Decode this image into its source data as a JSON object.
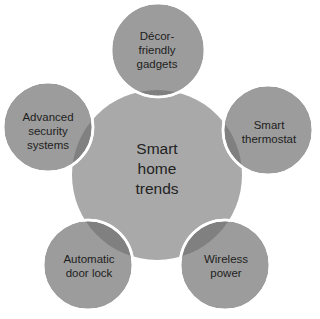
{
  "diagram": {
    "type": "radial-venn",
    "colors": {
      "background": "#ffffff",
      "main_fill": "#a8a8a8",
      "satellite_fill": "#9a9a9a",
      "overlap_fill": "#7f7f7f",
      "stroke": "#ffffff",
      "text": "#1e1e1e"
    },
    "center": {
      "lines": [
        "Smart",
        "home",
        "trends"
      ],
      "cx": 157,
      "cy": 175,
      "r": 85
    },
    "satellites": [
      {
        "id": "decor",
        "lines": [
          "Décor-",
          "friendly",
          "gadgets"
        ],
        "cx": 158,
        "cy": 50,
        "r": 47
      },
      {
        "id": "thermostat",
        "lines": [
          "Smart",
          "thermostat"
        ],
        "cx": 268,
        "cy": 130,
        "r": 45
      },
      {
        "id": "wireless",
        "lines": [
          "Wireless",
          "power"
        ],
        "cx": 225,
        "cy": 265,
        "r": 45
      },
      {
        "id": "doorlock",
        "lines": [
          "Automatic",
          "door lock"
        ],
        "cx": 88,
        "cy": 265,
        "r": 45
      },
      {
        "id": "security",
        "lines": [
          "Advanced",
          "security",
          "systems"
        ],
        "cx": 48,
        "cy": 127,
        "r": 45
      }
    ]
  }
}
